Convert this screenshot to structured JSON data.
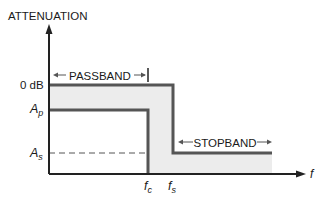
{
  "diagram": {
    "y_axis_label": "ATTENUATION",
    "x_axis_label": "f",
    "levels": {
      "zero_db": "0 dB",
      "ap_main": "A",
      "ap_sub": "p",
      "as_main": "A",
      "as_sub": "s"
    },
    "frequencies": {
      "fc_main": "f",
      "fc_sub": "c",
      "fs_main": "f",
      "fs_sub": "s"
    },
    "bands": {
      "passband": "PASSBAND",
      "stopband": "STOPBAND"
    },
    "colors": {
      "shade": "#ececec",
      "line": "#555555",
      "axis": "#222222"
    }
  }
}
